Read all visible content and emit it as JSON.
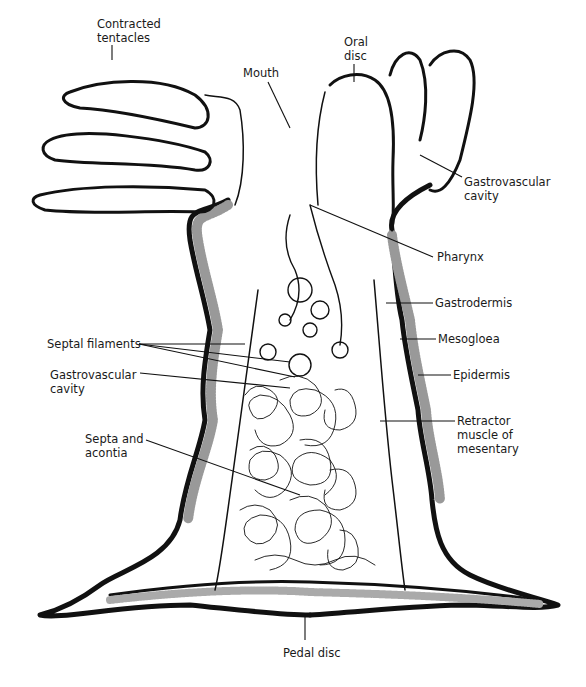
{
  "diagram": {
    "labels": [
      {
        "id": "contracted-tentacles",
        "text": "Contracted\ntentacles",
        "x": 97,
        "y": 17
      },
      {
        "id": "mouth",
        "text": "Mouth",
        "x": 243,
        "y": 66
      },
      {
        "id": "oral-disc",
        "text": "Oral\ndisc",
        "x": 344,
        "y": 35
      },
      {
        "id": "gastrovascular-cavity-top",
        "text": "Gastrovascular\ncavity",
        "x": 464,
        "y": 175
      },
      {
        "id": "pharynx",
        "text": "Pharynx",
        "x": 437,
        "y": 250
      },
      {
        "id": "gastrodermis",
        "text": "Gastrodermis",
        "x": 435,
        "y": 294
      },
      {
        "id": "mesogloea",
        "text": "Mesogloea",
        "x": 438,
        "y": 331
      },
      {
        "id": "epidermis",
        "text": "Epidermis",
        "x": 453,
        "y": 367
      },
      {
        "id": "retractor-muscle",
        "text": "Retractor\nmuscle of\nmesentary",
        "x": 457,
        "y": 414
      },
      {
        "id": "septal-filaments",
        "text": "Septal filaments",
        "x": 47,
        "y": 336
      },
      {
        "id": "gastrovascular-cavity-left",
        "text": "Gastrovascular\ncavity",
        "x": 50,
        "y": 370
      },
      {
        "id": "septa-acontia",
        "text": "Septa and\nacontia",
        "x": 85,
        "y": 430
      },
      {
        "id": "pedal-disc",
        "text": "Pedal disc",
        "x": 283,
        "y": 651
      }
    ]
  }
}
